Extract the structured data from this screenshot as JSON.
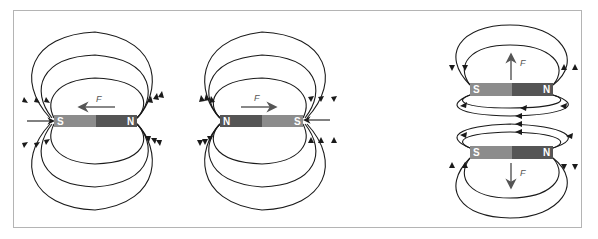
{
  "diagram": {
    "colors": {
      "south_pole": "#8c8c8c",
      "north_pole": "#555555",
      "field_line": "#1a1a1a",
      "force_arrow": "#555555",
      "frame": "#b4b4b4"
    },
    "panels": [
      {
        "id": "left",
        "description": "S-N magnet, force pointing left",
        "magnet": {
          "left_pole": "S",
          "right_pole": "N"
        },
        "force": {
          "label": "F",
          "direction": "left"
        }
      },
      {
        "id": "middle",
        "description": "N-S magnet, force pointing right",
        "magnet": {
          "left_pole": "N",
          "right_pole": "S"
        },
        "force": {
          "label": "F",
          "direction": "right"
        }
      },
      {
        "id": "right",
        "description": "Two stacked S-N magnets, forces pointing apart (up and down)",
        "magnets": [
          {
            "left_pole": "S",
            "right_pole": "N"
          },
          {
            "left_pole": "S",
            "right_pole": "N"
          }
        ],
        "forces": [
          {
            "label": "F",
            "direction": "up"
          },
          {
            "label": "F",
            "direction": "down"
          }
        ]
      }
    ]
  }
}
